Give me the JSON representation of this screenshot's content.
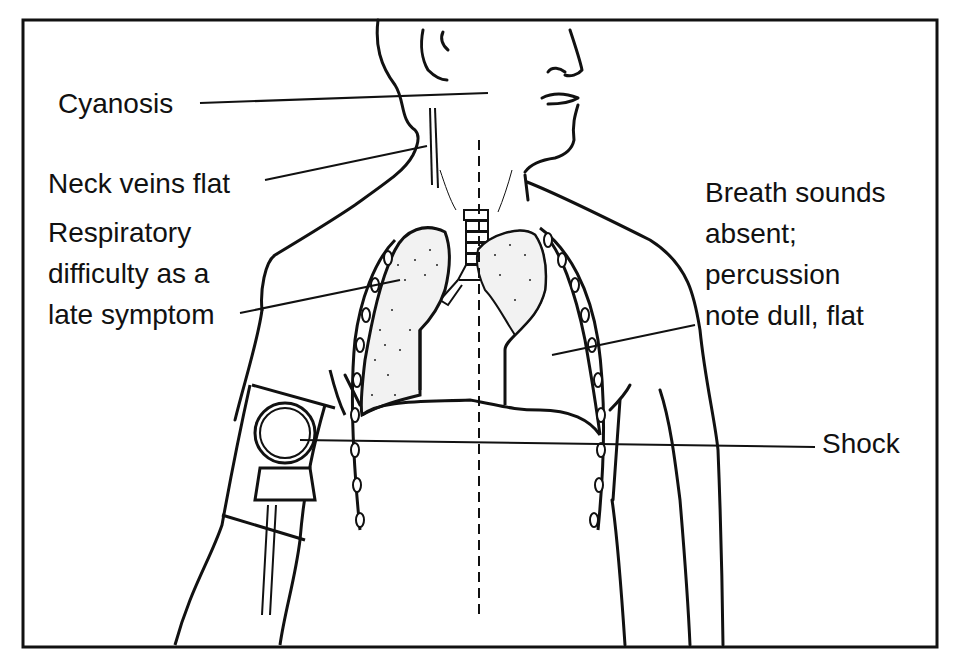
{
  "figure": {
    "frame_color": "#111111",
    "background": "#ffffff",
    "labels": {
      "cyanosis": "Cyanosis",
      "neck_veins": "Neck veins flat",
      "respiratory_1": "Respiratory",
      "respiratory_2": "difficulty as a",
      "respiratory_3": "late symptom",
      "breath_1": "Breath sounds",
      "breath_2": "absent;",
      "breath_3": "percussion",
      "breath_4": "note dull, flat",
      "shock": "Shock"
    },
    "icons": [
      "torso-outline",
      "head-profile",
      "trachea",
      "left-lung",
      "right-lung-collapsed",
      "rib-cage",
      "blood-pressure-cuff",
      "midline-dashed"
    ]
  }
}
